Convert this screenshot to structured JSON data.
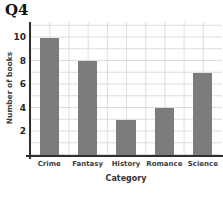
{
  "chart_data": {
    "type": "bar",
    "title": "Q4",
    "categories": [
      "Crime",
      "Fantasy",
      "History",
      "Romance",
      "Science"
    ],
    "values": [
      10,
      8,
      3,
      4,
      7
    ],
    "xlabel": "Category",
    "ylabel": "Number of books",
    "yticks": [
      2,
      4,
      6,
      8,
      10
    ],
    "ylim": [
      0,
      11.32
    ],
    "grid": true,
    "legend": "none",
    "bar_color": "#7c7c7c",
    "grid_color": "#dcdcdc",
    "axis_color": "#2f2f2f",
    "text_color": "#3d3d3d"
  }
}
